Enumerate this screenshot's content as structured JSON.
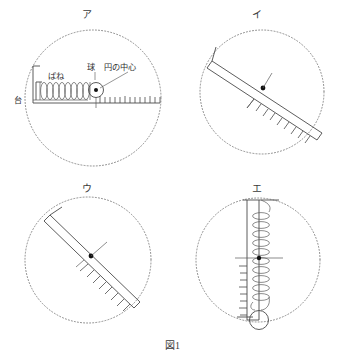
{
  "figure": {
    "caption": "図1",
    "panels": [
      {
        "key": "a",
        "label": "ア",
        "orientation": "horizontal",
        "annotations": {
          "spring": "ばね",
          "ball": "球",
          "center": "円の中心",
          "stand": "台"
        },
        "ruler_angle_deg": 0,
        "tick_count": 13,
        "spring_coils": 9,
        "circle_radius": 72
      },
      {
        "key": "i",
        "label": "イ",
        "orientation": "diagonal-shallow",
        "annotations": {},
        "ruler_angle_deg": 33,
        "tick_count": 9,
        "spring_coils": 0,
        "circle_radius": 62
      },
      {
        "key": "u",
        "label": "ウ",
        "orientation": "diagonal-steep",
        "annotations": {},
        "ruler_angle_deg": 45,
        "tick_count": 10,
        "spring_coils": 0,
        "circle_radius": 63
      },
      {
        "key": "e",
        "label": "エ",
        "orientation": "vertical",
        "annotations": {},
        "ruler_angle_deg": 90,
        "tick_count": 10,
        "spring_coils": 10,
        "circle_radius": 62
      }
    ]
  },
  "colors": {
    "ink": "#2b2b2b",
    "line": "#4a4a4a",
    "dotted": "#8a8a8a",
    "dot": "#111111",
    "background": "#ffffff"
  }
}
